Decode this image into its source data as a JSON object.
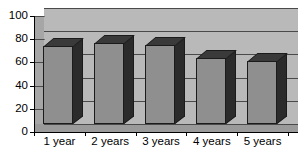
{
  "chart_data": {
    "type": "bar",
    "title": "",
    "subtitle": "",
    "xlabel": "",
    "ylabel": "",
    "categories": [
      "1 year",
      "2 years",
      "3 years",
      "4 years",
      "5 years"
    ],
    "values": [
      67,
      70,
      68,
      57,
      54
    ],
    "series": [
      {
        "name": "",
        "values": [
          67,
          70,
          68,
          57,
          54
        ]
      }
    ],
    "ylim": [
      0,
      100
    ],
    "ytick_labels": [
      "0",
      "20",
      "40",
      "60",
      "80",
      "100"
    ],
    "ytick_values": [
      0,
      20,
      40,
      60,
      80,
      100
    ],
    "grid": true,
    "grid_axis": "y",
    "legend": false,
    "legend_position": "none",
    "style": "3d-bar-grayscale",
    "colors": {
      "bar_face": "#8f8f8f",
      "bar_side": "#2b2b2b",
      "bar_top": "#3a3a3a",
      "bar_outline": "#1b1b1b",
      "plot_background": "#b9b9b9",
      "floor": "#9a9a9a",
      "gridline": "#4a4a4a",
      "axis": "#000000",
      "page_background": "#ffffff",
      "text": "#000000"
    }
  },
  "axes": {
    "y_ticks": [
      {
        "label": "100",
        "value": 100
      },
      {
        "label": "80",
        "value": 80
      },
      {
        "label": "60",
        "value": 60
      },
      {
        "label": "40",
        "value": 40
      },
      {
        "label": "20",
        "value": 20
      },
      {
        "label": "0",
        "value": 0
      }
    ],
    "x_ticks": [
      {
        "label": "1 year"
      },
      {
        "label": "2 years"
      },
      {
        "label": "3 years"
      },
      {
        "label": "4 years"
      },
      {
        "label": "5 years"
      }
    ]
  }
}
